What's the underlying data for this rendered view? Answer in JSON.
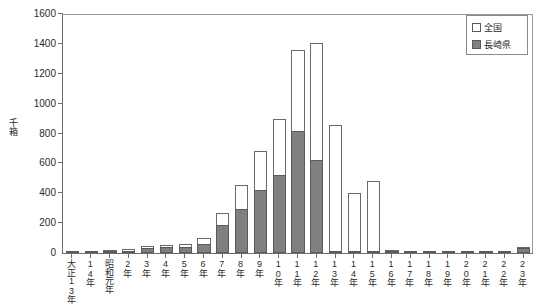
{
  "chart_data": {
    "type": "bar",
    "stacked_overlay": true,
    "title": "",
    "xlabel": "",
    "ylabel": "千箱",
    "ylim": [
      0,
      1600
    ],
    "ytick_step": 200,
    "yticks": [
      0,
      200,
      400,
      600,
      800,
      1000,
      1200,
      1400,
      1600
    ],
    "grid": false,
    "legend_position": "top-right",
    "categories": [
      "大正13年",
      "14年",
      "昭和元年",
      "2年",
      "3年",
      "4年",
      "5年",
      "6年",
      "7年",
      "8年",
      "9年",
      "10年",
      "11年",
      "12年",
      "13年",
      "14年",
      "15年",
      "16年",
      "17年",
      "18年",
      "19年",
      "20年",
      "21年",
      "22年",
      "23年"
    ],
    "series": [
      {
        "name": "全国",
        "color": "#ffffff",
        "edge": "#6a6a6a",
        "values": [
          5,
          12,
          20,
          25,
          48,
          52,
          58,
          98,
          270,
          455,
          680,
          900,
          1360,
          1405,
          860,
          400,
          480,
          18,
          6,
          5,
          5,
          6,
          6,
          8,
          40
        ]
      },
      {
        "name": "長崎県",
        "color": "#808080",
        "edge": "#5a5a5a",
        "values": [
          2,
          5,
          10,
          14,
          34,
          38,
          42,
          60,
          190,
          295,
          425,
          520,
          820,
          625,
          6,
          4,
          3,
          14,
          2,
          2,
          2,
          2,
          2,
          3,
          32
        ]
      }
    ]
  },
  "legend": {
    "items": [
      {
        "label": "全国"
      },
      {
        "label": "長崎県"
      }
    ]
  },
  "axis": {
    "y_title": "千箱"
  }
}
